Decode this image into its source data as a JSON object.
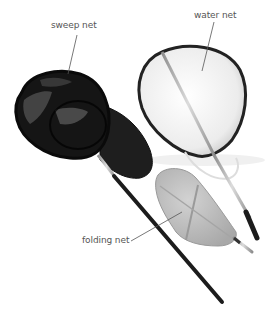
{
  "figure": {
    "labels": {
      "sweep_net": "sweep net",
      "water_net": "water net",
      "folding_net": "folding net"
    },
    "colors": {
      "background": "#ffffff",
      "label_text": "#555555",
      "leader_line": "#555555",
      "sweep_net_mesh": "#1a1a1a",
      "water_net_mesh": "#f2f2f2",
      "folding_net_mesh": "#bdbdbd",
      "handle_dark": "#1c1c1c",
      "handle_metal": "#b5b5b5"
    }
  }
}
